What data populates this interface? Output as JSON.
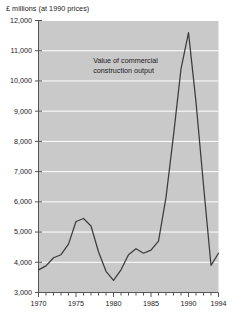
{
  "chart_data": {
    "type": "line",
    "title": "",
    "ylabel": "£ millions (at 1990 prices)",
    "xlabel": "",
    "ylim": [
      3000,
      12000
    ],
    "xlim": [
      1970,
      1994
    ],
    "ytick_labels": [
      "12,000",
      "11,000",
      "10,000",
      "9,000",
      "8,000",
      "7,000",
      "6,000",
      "5,000",
      "4,000",
      "3,000"
    ],
    "ytick_values": [
      12000,
      11000,
      10000,
      9000,
      8000,
      7000,
      6000,
      5000,
      4000,
      3000
    ],
    "xtick_labels": [
      "1970",
      "1975",
      "1980",
      "1985",
      "1990",
      "1994"
    ],
    "xtick_values": [
      1970,
      1975,
      1980,
      1985,
      1990,
      1994
    ],
    "xminor_step": 1,
    "grid": "horizontal-white",
    "legend": "none",
    "plot_background": "#c9c9c9",
    "line_color": "#3c3c3c",
    "annotations": [
      {
        "name": "series-annotation",
        "line1": "Value of commercial",
        "line2": "construction output",
        "x": 1985.3,
        "y": 10650
      }
    ],
    "series": [
      {
        "name": "Value of commercial construction output",
        "x": [
          1970,
          1971,
          1972,
          1973,
          1974,
          1975,
          1976,
          1977,
          1978,
          1979,
          1980,
          1981,
          1982,
          1983,
          1984,
          1985,
          1986,
          1987,
          1988,
          1989,
          1990,
          1991,
          1992,
          1993,
          1994
        ],
        "values": [
          3750,
          3880,
          4150,
          4250,
          4600,
          5350,
          5450,
          5200,
          4350,
          3700,
          3400,
          3750,
          4250,
          4450,
          4300,
          4400,
          4700,
          6150,
          8200,
          10400,
          11600,
          9300,
          6550,
          3900,
          4300
        ]
      }
    ]
  }
}
